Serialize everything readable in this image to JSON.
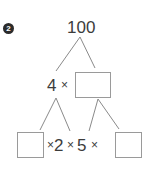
{
  "problem": {
    "number": "2"
  },
  "tree": {
    "root": "100",
    "middle": {
      "factor": "4",
      "operator": "×",
      "blank_box": ""
    },
    "bottom": {
      "left_box": "",
      "op1": "×",
      "factor1": "2",
      "op2": "×",
      "factor2": "5",
      "op3": "×",
      "right_box": ""
    }
  },
  "colors": {
    "text": "#3c3c3c",
    "lines": "#8a8a8a",
    "box_border": "#9a9a9a",
    "badge": "#2b2b2b"
  }
}
